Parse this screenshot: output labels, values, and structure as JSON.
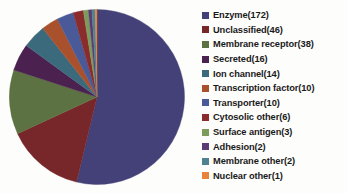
{
  "chart_data": {
    "type": "pie",
    "title": "",
    "legend_position": "right",
    "total": 300,
    "categories": [
      "Enzyme",
      "Unclassified",
      "Membrane receptor",
      "Secreted",
      "Ion channel",
      "Transcription factor",
      "Transporter",
      "Cytosolic other",
      "Surface antigen",
      "Adhesion",
      "Membrane other",
      "Nuclear other"
    ],
    "values": [
      172,
      46,
      38,
      16,
      14,
      10,
      10,
      6,
      3,
      2,
      2,
      1
    ],
    "labels": [
      "Enzyme(172)",
      "Unclassified(46)",
      "Membrane receptor(38)",
      "Secreted(16)",
      "Ion channel(14)",
      "Transcription factor(10)",
      "Transporter(10)",
      "Cytosolic other(6)",
      "Surface antigen(3)",
      "Adhesion(2)",
      "Membrane other(2)",
      "Nuclear other(1)"
    ],
    "colors": [
      "#434178",
      "#77262a",
      "#5d7242",
      "#4b2150",
      "#3c6a7d",
      "#a8512c",
      "#4a5a99",
      "#8a2b2c",
      "#7d9b5c",
      "#5a3b74",
      "#4f8190",
      "#e8823c"
    ]
  }
}
